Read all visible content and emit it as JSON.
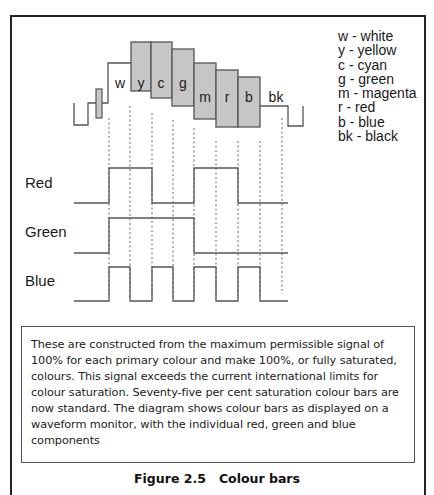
{
  "figure": {
    "caption_number": "Figure 2.5",
    "caption_title": "Colour bars",
    "caption": "Figure 2.5   Colour bars"
  },
  "waveform": {
    "bar_labels": [
      "w",
      "y",
      "c",
      "g",
      "m",
      "r",
      "b",
      "bk"
    ],
    "bar_fill": "#c6c6c6",
    "line_color": "#555555"
  },
  "legend": {
    "items": [
      {
        "key": "w",
        "label": "w - white"
      },
      {
        "key": "y",
        "label": "y - yellow"
      },
      {
        "key": "c",
        "label": "c - cyan"
      },
      {
        "key": "g",
        "label": "g - green"
      },
      {
        "key": "m",
        "label": "m - magenta"
      },
      {
        "key": "r",
        "label": "r - red"
      },
      {
        "key": "b",
        "label": "b - blue"
      },
      {
        "key": "bk",
        "label": "bk - black"
      }
    ]
  },
  "signals": {
    "red": {
      "label": "Red",
      "pattern": [
        1,
        1,
        0,
        0,
        1,
        1,
        0,
        0
      ]
    },
    "green": {
      "label": "Green",
      "pattern": [
        1,
        1,
        1,
        1,
        0,
        0,
        0,
        0
      ]
    },
    "blue": {
      "label": "Blue",
      "pattern": [
        1,
        0,
        1,
        0,
        1,
        0,
        1,
        0
      ]
    }
  },
  "description": {
    "text": "These are constructed from the maximum permissible signal of 100% for each primary colour and make 100%, or fully saturated, colours. This signal exceeds the current international limits for colour saturation. Seventy-five per cent saturation colour bars are now standard. The diagram shows colour bars as displayed on a waveform monitor, with the individual red, green and blue components"
  }
}
